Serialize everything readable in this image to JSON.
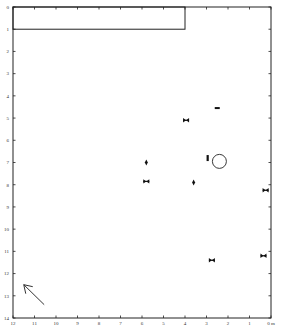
{
  "chart_data": {
    "type": "scatter",
    "title": "",
    "x_axis": {
      "range": [
        12,
        0
      ],
      "ticks": [
        12,
        11,
        10,
        9,
        8,
        7,
        6,
        5,
        4,
        3,
        2,
        1,
        0
      ],
      "tick_labels": [
        "12",
        "11",
        "10",
        "9",
        "8",
        "7",
        "6",
        "5",
        "4",
        "3",
        "2",
        "1",
        "0 m"
      ],
      "position": "bottom"
    },
    "y_axis": {
      "range": [
        0,
        14
      ],
      "ticks": [
        0,
        1,
        2,
        3,
        4,
        5,
        6,
        7,
        8,
        9,
        10,
        11,
        12,
        13,
        14
      ],
      "tick_labels": [
        "0",
        "1",
        "2",
        "3",
        "4",
        "5",
        "6",
        "7",
        "8",
        "9",
        "10",
        "11",
        "12",
        "13",
        "14"
      ],
      "position": "left",
      "inverted": true
    },
    "grid": false,
    "structure_rectangle": {
      "x": [
        4,
        12
      ],
      "y": [
        0,
        1
      ]
    },
    "points": [
      {
        "x": 2.5,
        "y": 4.55,
        "marker": "dash"
      },
      {
        "x": 3.95,
        "y": 5.1,
        "marker": "bowtie"
      },
      {
        "x": 2.95,
        "y": 6.8,
        "marker": "bar"
      },
      {
        "x": 2.4,
        "y": 6.95,
        "marker": "circle"
      },
      {
        "x": 5.8,
        "y": 7.0,
        "marker": "diamond"
      },
      {
        "x": 5.8,
        "y": 7.85,
        "marker": "bowtie"
      },
      {
        "x": 3.6,
        "y": 7.9,
        "marker": "diamond"
      },
      {
        "x": 0.25,
        "y": 8.25,
        "marker": "bowtie"
      },
      {
        "x": 0.35,
        "y": 11.2,
        "marker": "bowtie"
      },
      {
        "x": 2.75,
        "y": 11.4,
        "marker": "bowtie"
      }
    ],
    "north_arrow": {
      "from": [
        10.55,
        13.4
      ],
      "to": [
        11.5,
        12.5
      ]
    }
  }
}
